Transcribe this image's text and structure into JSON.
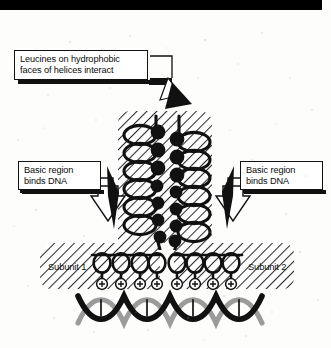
{
  "figure": {
    "type": "biology-schematic",
    "width": 331,
    "height": 348,
    "background_color": "#fdfdfc",
    "ink_color": "#111111"
  },
  "callouts": [
    {
      "id": "leucines",
      "text": "Leucines on hydrophobic\nfaces of helices interact",
      "points_to": "coiled-coil-zipper-region",
      "arrow_style": "solid-black-arrowhead"
    },
    {
      "id": "basic-left",
      "text": "Basic region\nbinds DNA",
      "points_to": "basic-region-subunit-1",
      "arrow_style": "hollow-outlined-arrow"
    },
    {
      "id": "basic-right",
      "text": "Basic region\nbinds DNA",
      "points_to": "basic-region-subunit-2",
      "arrow_style": "hollow-outlined-arrow"
    }
  ],
  "labels": {
    "subunit_1": "Subunit 1",
    "subunit_2": "Subunit 2"
  },
  "structure": {
    "zipper": {
      "helix_count": 2,
      "turns_per_helix": 7,
      "leucine_marker": "filled-black-circle",
      "leucines_per_helix": 7,
      "shading": "diagonal-hatch"
    },
    "basic_region": {
      "subunits": 2,
      "helix_turns_per_subunit": 4,
      "charge_symbol": "+",
      "charges_per_subunit": 4,
      "shading": "diagonal-hatch"
    },
    "dna": {
      "form": "double-helix",
      "strand_count": 2,
      "turns": 4,
      "strand_colors": [
        "#111111",
        "#9a9a9a"
      ]
    }
  },
  "top_artifact": {
    "description": "black scan band across top edge",
    "color": "#000000"
  }
}
